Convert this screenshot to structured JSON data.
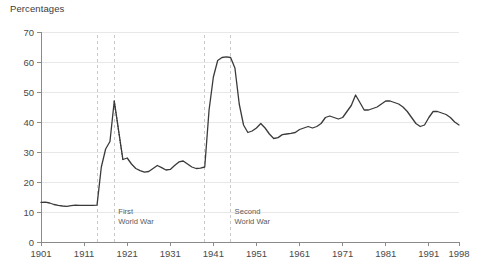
{
  "chart_data": {
    "type": "line",
    "title": "Percentages",
    "xlabel": "",
    "ylabel": "",
    "xlim": [
      1901,
      1998
    ],
    "ylim": [
      0,
      70
    ],
    "yticks": [
      0,
      10,
      20,
      30,
      40,
      50,
      60,
      70
    ],
    "xticks": [
      1901,
      1911,
      1921,
      1931,
      1941,
      1951,
      1961,
      1971,
      1981,
      1991,
      1998
    ],
    "grid": "horizontal",
    "legend": "none",
    "annotations": [
      {
        "name": "first-world-war",
        "label_line1": "First",
        "label_line2": "World War",
        "start_year": 1914,
        "end_year": 1918
      },
      {
        "name": "second-world-war",
        "label_line1": "Second",
        "label_line2": "World War",
        "start_year": 1939,
        "end_year": 1945
      }
    ],
    "series": [
      {
        "name": "main",
        "style": "solid",
        "x": [
          1901,
          1902,
          1903,
          1904,
          1905,
          1906,
          1907,
          1908,
          1909,
          1910,
          1911,
          1912,
          1913,
          1914,
          1915,
          1916,
          1917,
          1918,
          1920,
          1921,
          1922,
          1923,
          1924,
          1925,
          1926,
          1927,
          1928,
          1929,
          1930,
          1931,
          1932,
          1933,
          1934,
          1935,
          1936,
          1937,
          1938,
          1939,
          1940,
          1941,
          1942,
          1943,
          1944,
          1945,
          1946,
          1947,
          1948,
          1949,
          1950,
          1951,
          1952,
          1953,
          1954,
          1955,
          1956,
          1957,
          1958,
          1959,
          1960,
          1961,
          1962,
          1963,
          1964,
          1965,
          1966,
          1967,
          1968,
          1969,
          1970,
          1971,
          1972,
          1973,
          1974,
          1975,
          1976,
          1977,
          1978,
          1979,
          1980,
          1981,
          1982,
          1983,
          1984,
          1985,
          1986,
          1987,
          1988,
          1989,
          1990,
          1991,
          1992,
          1993,
          1994,
          1995,
          1996,
          1997,
          1998
        ],
        "y": [
          13.2,
          13.3,
          13.0,
          12.5,
          12.2,
          12.0,
          11.9,
          12.1,
          12.3,
          12.2,
          12.2,
          12.2,
          12.2,
          12.3,
          25.0,
          31.0,
          33.5,
          47.0,
          27.5,
          28.0,
          26.0,
          24.5,
          23.8,
          23.3,
          23.5,
          24.5,
          25.5,
          24.8,
          24.0,
          24.2,
          25.5,
          26.7,
          27.0,
          26.0,
          25.0,
          24.5,
          24.6,
          25.0,
          44.0,
          55.0,
          60.5,
          61.5,
          61.7,
          61.5,
          58.0,
          46.0,
          39.0,
          36.5,
          37.0,
          38.0,
          39.5,
          38.0,
          36.0,
          34.5,
          34.8,
          35.8,
          36.0,
          36.2,
          36.5,
          37.5,
          38.0,
          38.5,
          38.0,
          38.5,
          39.5,
          41.5,
          42.0,
          41.5,
          41.0,
          41.5,
          43.5,
          45.5,
          49.0,
          46.5,
          44.0,
          44.0,
          44.5,
          45.0,
          46.0,
          47.0,
          47.0,
          46.5,
          46.0,
          45.0,
          43.5,
          41.5,
          39.5,
          38.5,
          39.0,
          41.5,
          43.5,
          43.5,
          43.0,
          42.5,
          41.5,
          40.0,
          39.0
        ]
      },
      {
        "name": "interpolated-gap",
        "style": "dotted",
        "x": [
          1918,
          1919,
          1920
        ],
        "y": [
          47.0,
          37.0,
          27.5
        ]
      }
    ]
  },
  "axis": {
    "y_tick_labels": [
      "0",
      "10",
      "20",
      "30",
      "40",
      "50",
      "60",
      "70"
    ],
    "x_tick_labels": [
      "1901",
      "1911",
      "1921",
      "1931",
      "1941",
      "1951",
      "1961",
      "1971",
      "1981",
      "1991",
      "1998"
    ]
  },
  "colors": {
    "line": "#3a3a3a",
    "grid": "#e8e8e8",
    "axis": "#8a8a8a",
    "dashed_marker": "#c9c9c9",
    "text": "#4a4a4a"
  }
}
